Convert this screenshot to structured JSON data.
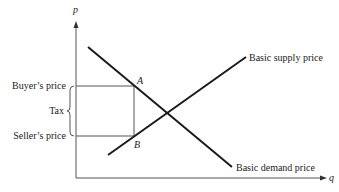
{
  "figure": {
    "axes": {
      "y_label": "p",
      "x_label": "q"
    },
    "curves": {
      "supply_label": "Basic supply price",
      "demand_label": "Basic demand price"
    },
    "points": {
      "a_label": "A",
      "b_label": "B"
    },
    "left_labels": {
      "buyers_price": "Buyer’s price",
      "tax": "Tax",
      "sellers_price": "Seller’s price"
    },
    "colors": {
      "line": "#1a1a1a",
      "axis": "#555555",
      "text": "#222222"
    }
  }
}
